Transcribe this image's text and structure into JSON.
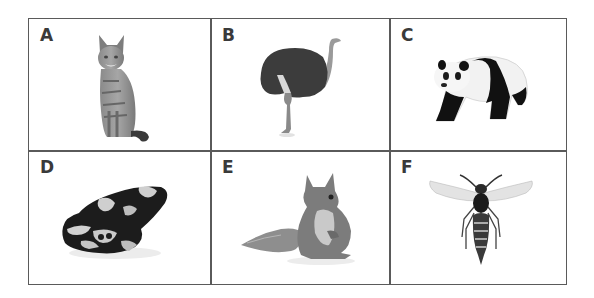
{
  "panels": [
    {
      "label": "A",
      "animal": "cat",
      "icon": "cat-icon"
    },
    {
      "label": "B",
      "animal": "ostrich",
      "icon": "ostrich-icon"
    },
    {
      "label": "C",
      "animal": "panda",
      "icon": "panda-icon"
    },
    {
      "label": "D",
      "animal": "frog",
      "icon": "frog-icon"
    },
    {
      "label": "E",
      "animal": "squirrel",
      "icon": "squirrel-icon"
    },
    {
      "label": "F",
      "animal": "wasp",
      "icon": "wasp-icon"
    }
  ],
  "colors": {
    "grid_line": "#5a5a5a",
    "label_text": "#3a3a3a",
    "background": "#ffffff"
  }
}
